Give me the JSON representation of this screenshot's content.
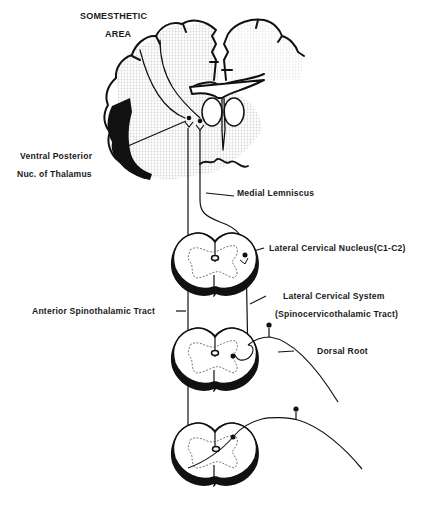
{
  "diagram": {
    "colors": {
      "ink": "#111111",
      "background": "#ffffff",
      "stipple": "#e6e6e6"
    },
    "labels": {
      "somesthetic_line1": "SOMESTHETIC",
      "somesthetic_line2": "AREA",
      "vp_line1": "Ventral Posterior",
      "vp_line2": "Nuc. of Thalamus",
      "medial_lemniscus": "Medial Lemniscus",
      "lateral_cervical_nucleus": "Lateral Cervical Nucleus(C1-C2)",
      "anterior_spinothalamic": "Anterior Spinothalamic Tract",
      "lateral_cervical_system": "Lateral Cervical System",
      "spinocervicothalamic": "(Spinocervicothalamic Tract)",
      "dorsal_root": "Dorsal Root"
    },
    "structures": [
      "brain-coronal-section",
      "thalamus",
      "spinal-cord-section-upper",
      "spinal-cord-section-middle",
      "spinal-cord-section-lower",
      "dorsal-root-ganglion-middle",
      "dorsal-root-ganglion-lower"
    ]
  }
}
